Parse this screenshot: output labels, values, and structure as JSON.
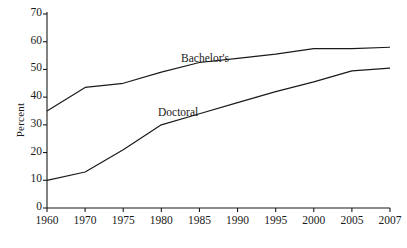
{
  "chart_data": {
    "type": "line",
    "title": "",
    "xlabel": "",
    "ylabel": "Percent",
    "ylim": [
      0,
      70
    ],
    "yticks": [
      0,
      10,
      20,
      30,
      40,
      50,
      60,
      70
    ],
    "grid": false,
    "legend_position": "inline-annotations",
    "categories": [
      "1960",
      "1970",
      "1975",
      "1980",
      "1985",
      "1990",
      "1995",
      "2000",
      "2005",
      "2007"
    ],
    "series": [
      {
        "name": "Bachelor's",
        "color": "#1a1a1a",
        "values": [
          35,
          43.5,
          45,
          49,
          52.5,
          54,
          55.5,
          57.5,
          57.5,
          58
        ]
      },
      {
        "name": "Doctoral",
        "color": "#1a1a1a",
        "values": [
          10,
          13,
          21,
          30,
          34,
          38,
          42,
          45.5,
          49.5,
          50.5
        ]
      }
    ],
    "annotations": [
      {
        "text": "Bachelor's",
        "series": "Bachelor's",
        "x_px": 181,
        "y_px": 52
      },
      {
        "text": "Doctoral",
        "series": "Doctoral",
        "x_px": 158,
        "y_px": 106
      }
    ]
  },
  "axis": {
    "y_title": "Percent",
    "y_tick_labels": [
      "70",
      "60",
      "50",
      "40",
      "30",
      "20",
      "10",
      "0"
    ],
    "x_tick_labels": [
      "1960",
      "1970",
      "1975",
      "1980",
      "1985",
      "1990",
      "1995",
      "2000",
      "2005",
      "2007"
    ]
  },
  "colors": {
    "line": "#1a1a1a",
    "axis": "#1a1a1a",
    "background": "#ffffff"
  }
}
